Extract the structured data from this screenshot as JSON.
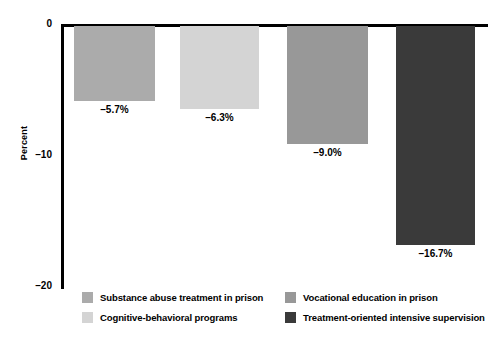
{
  "chart_data": {
    "type": "bar",
    "title": "",
    "xlabel": "",
    "ylabel": "Percent",
    "ylim": [
      -20,
      0
    ],
    "yticks": [
      0,
      -10,
      -20
    ],
    "ytick_labels": [
      "0",
      "–10",
      "–20"
    ],
    "grid": false,
    "orientation": "vertical",
    "categories": [
      "Substance abuse treatment in prison",
      "Cognitive-behavioral programs",
      "Vocational education in prison",
      "Treatment-oriented intensive supervision"
    ],
    "values": [
      -5.7,
      -6.3,
      -9.0,
      -16.7
    ],
    "data_labels": [
      "–5.7%",
      "–6.3%",
      "–9.0%",
      "–16.7%"
    ],
    "colors": [
      "#ababab",
      "#d4d4d4",
      "#989898",
      "#3a3a3a"
    ],
    "legend_position": "bottom"
  },
  "axis": {
    "y_title": "Percent",
    "ticks": [
      {
        "label": "0"
      },
      {
        "label": "–10"
      },
      {
        "label": "–20"
      }
    ]
  },
  "bars": [
    {
      "label": "–5.7%",
      "color": "#ababab"
    },
    {
      "label": "–6.3%",
      "color": "#d4d4d4"
    },
    {
      "label": "–9.0%",
      "color": "#989898"
    },
    {
      "label": "–16.7%",
      "color": "#3a3a3a"
    }
  ],
  "legend": {
    "items": [
      {
        "label": "Substance abuse treatment in prison",
        "color": "#ababab"
      },
      {
        "label": "Cognitive-behavioral programs",
        "color": "#d4d4d4"
      },
      {
        "label": "Vocational education in prison",
        "color": "#989898"
      },
      {
        "label": "Treatment-oriented intensive supervision",
        "color": "#3a3a3a"
      }
    ]
  }
}
